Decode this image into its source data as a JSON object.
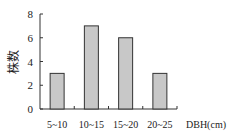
{
  "chart_data": {
    "type": "bar",
    "title": "",
    "xlabel": "DBH(cm)",
    "ylabel": "株数",
    "categories": [
      "5~10",
      "10~15",
      "15~20",
      "20~25"
    ],
    "values": [
      3,
      7,
      6,
      3
    ],
    "ylim": [
      0,
      8
    ],
    "yticks": [
      0,
      2,
      4,
      6,
      8
    ],
    "grid": false,
    "legend": null,
    "bar_color": "#c8c8c8",
    "bar_edge_color": "#333333"
  }
}
